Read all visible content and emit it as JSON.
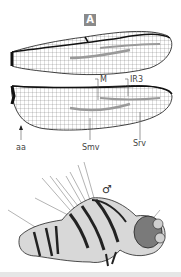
{
  "figure": {
    "panel_label": "A",
    "wing_labels": {
      "M": "M",
      "IR3": "IR3",
      "aa": "aa",
      "Smv": "Smv",
      "Srv": "Srv"
    },
    "sex_symbol": "♂",
    "colors": {
      "vein": "#1a1a1a",
      "membrane": "#ffffff",
      "highlight_band": "#9a9a9a",
      "badge": "#8a8a8a",
      "body_dark": "#222222",
      "body_light": "#d8d8d8"
    }
  }
}
